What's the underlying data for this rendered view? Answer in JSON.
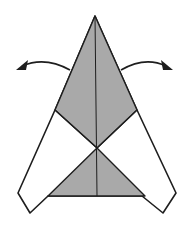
{
  "diagram": {
    "type": "origami-step",
    "colors": {
      "background": "#ffffff",
      "colored_side": "#a9a9a9",
      "white_side": "#ffffff",
      "line": "#1e1e1e"
    },
    "arrows": [
      {
        "name": "unfold-left-arrow",
        "direction": "left"
      },
      {
        "name": "unfold-right-arrow",
        "direction": "right"
      }
    ]
  }
}
